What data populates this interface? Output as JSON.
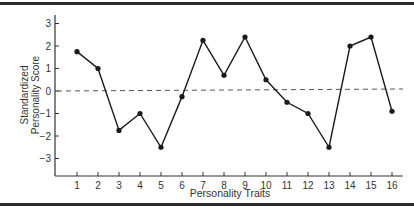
{
  "chart_data": {
    "type": "line",
    "title": "",
    "xlabel": "Personality Traits",
    "ylabel_lines": [
      "Standardized",
      "Personality Score"
    ],
    "ylabel": "Standardized Personality Score",
    "x": [
      1,
      2,
      3,
      4,
      5,
      6,
      7,
      8,
      9,
      10,
      11,
      12,
      13,
      14,
      15,
      16
    ],
    "categories": [
      "1",
      "2",
      "3",
      "4",
      "5",
      "6",
      "7",
      "8",
      "9",
      "10",
      "11",
      "12",
      "13",
      "14",
      "15",
      "16"
    ],
    "series": [
      {
        "name": "Standardized Personality Score",
        "values": [
          1.75,
          1.0,
          -1.75,
          -1.0,
          -2.5,
          -0.25,
          2.25,
          0.7,
          2.4,
          0.5,
          -0.5,
          -1.0,
          -2.5,
          2.0,
          2.4,
          -0.9
        ],
        "color": "#1a1a1a",
        "marker": "filled-circle"
      }
    ],
    "yticks": [
      3,
      2,
      1,
      0,
      -1,
      -2,
      -3
    ],
    "ytick_labels": [
      "3",
      "2",
      "1",
      "0",
      "−1",
      "−2",
      "−3"
    ],
    "ylim": [
      -3.5,
      3.5
    ],
    "reference_line": {
      "y": 0,
      "style": "dashed",
      "color": "#555555"
    },
    "grid": false,
    "legend": null
  }
}
